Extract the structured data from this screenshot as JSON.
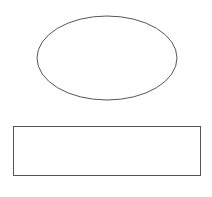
{
  "canvas": {
    "width": 212,
    "height": 197,
    "background": "#ffffff"
  },
  "shapes": [
    {
      "type": "ellipse",
      "label": "",
      "cx": 107,
      "cy": 58,
      "rx": 70,
      "ry": 42,
      "stroke": "#555555",
      "fill": "#ffffff"
    },
    {
      "type": "rectangle",
      "label": "",
      "x": 13.5,
      "y": 126.5,
      "width": 187,
      "height": 49,
      "stroke": "#555555",
      "fill": "#ffffff"
    }
  ]
}
